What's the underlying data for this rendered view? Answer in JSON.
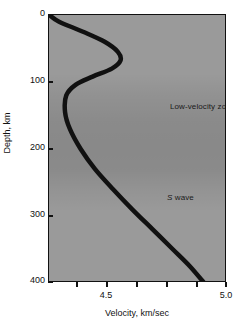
{
  "chart_data": {
    "type": "line",
    "title": "",
    "xlabel": "Velocity, km/sec",
    "ylabel": "Depth, km",
    "xlim": [
      4.258,
      5.0
    ],
    "ylim": [
      0,
      400
    ],
    "y_inverted": true,
    "grid": false,
    "legend": "none",
    "xticks_labeled": [
      {
        "value": 4.5,
        "label": "4.5"
      },
      {
        "value": 5.0,
        "label": "5.0"
      }
    ],
    "xticks_minor": [
      4.375,
      4.5,
      4.625,
      4.75,
      4.875,
      5.0
    ],
    "yticks": [
      {
        "value": 0,
        "label": "0"
      },
      {
        "value": 100,
        "label": "100"
      },
      {
        "value": 200,
        "label": "200"
      },
      {
        "value": 300,
        "label": "300"
      },
      {
        "value": 400,
        "label": "400"
      }
    ],
    "annotations": [
      {
        "text": "Low-velocity zone",
        "velocity": 4.76,
        "depth": 115
      },
      {
        "text_italic": "S",
        "text": " wave",
        "velocity": 4.75,
        "depth": 252
      }
    ],
    "series": [
      {
        "name": "S wave",
        "color": "#111111",
        "line_width_px": 4.5,
        "points": [
          {
            "depth": 0,
            "velocity": 4.26
          },
          {
            "depth": 10,
            "velocity": 4.3
          },
          {
            "depth": 25,
            "velocity": 4.4
          },
          {
            "depth": 40,
            "velocity": 4.49
          },
          {
            "depth": 55,
            "velocity": 4.545
          },
          {
            "depth": 68,
            "velocity": 4.556
          },
          {
            "depth": 80,
            "velocity": 4.52
          },
          {
            "depth": 92,
            "velocity": 4.44
          },
          {
            "depth": 104,
            "velocity": 4.37
          },
          {
            "depth": 120,
            "velocity": 4.33
          },
          {
            "depth": 145,
            "velocity": 4.325
          },
          {
            "depth": 170,
            "velocity": 4.345
          },
          {
            "depth": 200,
            "velocity": 4.39
          },
          {
            "depth": 230,
            "velocity": 4.45
          },
          {
            "depth": 260,
            "velocity": 4.525
          },
          {
            "depth": 290,
            "velocity": 4.605
          },
          {
            "depth": 320,
            "velocity": 4.69
          },
          {
            "depth": 350,
            "velocity": 4.775
          },
          {
            "depth": 375,
            "velocity": 4.845
          },
          {
            "depth": 400,
            "velocity": 4.905
          }
        ]
      }
    ]
  },
  "axes": {
    "y_title": "Depth, km",
    "x_title": "Velocity, km/sec",
    "y_tick_labels": [
      "0",
      "100",
      "200",
      "300",
      "400"
    ],
    "x_tick_labels": [
      "4.5",
      "5.0"
    ]
  },
  "labels": {
    "low_velocity_zone": "Low-velocity zone",
    "s_wave_italic": "S",
    "s_wave_rest": " wave"
  },
  "colors": {
    "plot_background": "#9a9a9a",
    "curve": "#111111",
    "axis": "#111111",
    "page_background": "#ffffff"
  }
}
